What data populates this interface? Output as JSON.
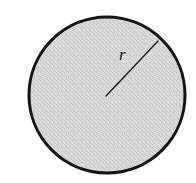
{
  "figure": {
    "kind": "geometry-diagram",
    "background_color": "#ffffff",
    "canvas": {
      "width": 196,
      "height": 183
    },
    "circle": {
      "name": "circle",
      "center_x": 107,
      "center_y": 95,
      "radius": 78,
      "fill_color": "#d6d6d6",
      "stroke_color": "#141414",
      "stroke_width": 3,
      "fill_pattern": "stipple"
    },
    "radius_segment": {
      "name": "radius-line",
      "x1": 106,
      "y1": 96,
      "x2": 158,
      "y2": 41,
      "stroke_color": "#1a1a1a",
      "stroke_width": 1.4
    },
    "labels": {
      "radius": "r"
    }
  }
}
